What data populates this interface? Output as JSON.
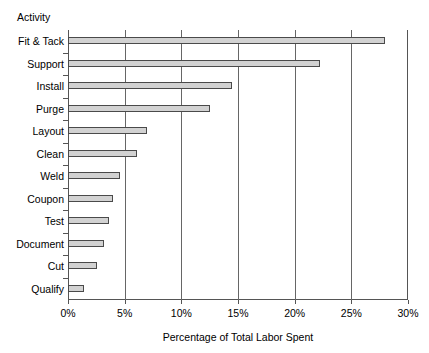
{
  "chart_data": {
    "type": "bar",
    "orientation": "horizontal",
    "title": "",
    "subtitle": "",
    "ylabel": "Activity",
    "xlabel": "Percentage of Total Labor Spent",
    "categories": [
      "Fit & Tack",
      "Support",
      "Install",
      "Purge",
      "Layout",
      "Clean",
      "Weld",
      "Coupon",
      "Test",
      "Document",
      "Cut",
      "Qualify"
    ],
    "values": [
      28.0,
      22.2,
      14.5,
      12.5,
      7.0,
      6.1,
      4.6,
      4.0,
      3.6,
      3.2,
      2.6,
      1.4
    ],
    "xlim": [
      0,
      30
    ],
    "xticks": [
      0,
      5,
      10,
      15,
      20,
      25,
      30
    ],
    "xtick_labels": [
      "0%",
      "5%",
      "10%",
      "15%",
      "20%",
      "25%",
      "30%"
    ],
    "grid": "vertical",
    "legend": "none",
    "bar_fill_color": "#d2d2d2",
    "bar_border_color": "#4a4a4a",
    "axis_color": "#555555",
    "gridline_color": "#666666",
    "background_color": "#ffffff"
  }
}
